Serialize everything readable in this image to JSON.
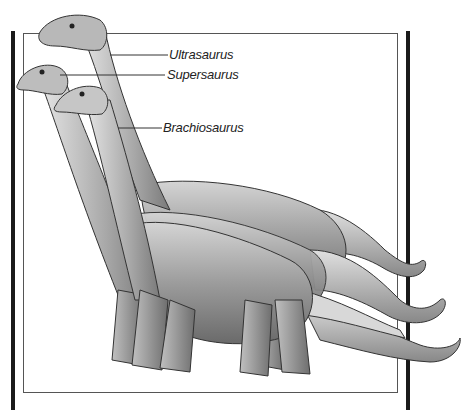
{
  "figure": {
    "labels": [
      {
        "id": "ultrasaurus",
        "text": "Ultrasaurus"
      },
      {
        "id": "supersaurus",
        "text": "Supersaurus"
      },
      {
        "id": "brachiosaurus",
        "text": "Brachiosaurus"
      }
    ],
    "colors": {
      "frame": "#1a1a1a",
      "box": "#555555",
      "body_dark": "#6e6e6e",
      "body_mid": "#9a9a9a",
      "body_light": "#c8c8c8",
      "label_text": "#222222"
    }
  }
}
